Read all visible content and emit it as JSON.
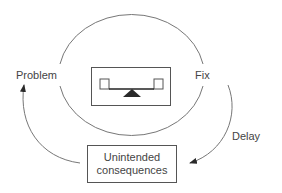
{
  "diagram": {
    "type": "systems-archetype",
    "nodes": {
      "problem": {
        "label": "Problem"
      },
      "fix": {
        "label": "Fix"
      },
      "unintended": {
        "line1": "Unintended",
        "line2": "consequences"
      }
    },
    "edges": {
      "delay": {
        "label": "Delay"
      }
    },
    "center_icon": "balance-scale-icon",
    "colors": {
      "stroke": "#555555",
      "text": "#444444",
      "fill": "#2a2a2a",
      "background": "#ffffff"
    }
  }
}
